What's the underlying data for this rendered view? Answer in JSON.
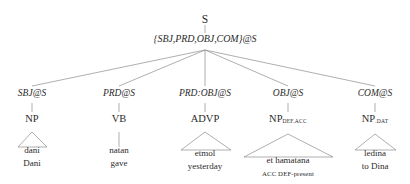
{
  "diagram": {
    "type": "syntax-tree",
    "root": {
      "label": "S"
    },
    "feature_set": {
      "label": "{SBJ,PRD,OBJ,COM}@S"
    },
    "branches": [
      {
        "function": "SBJ@S",
        "category": "NP",
        "subscript": "",
        "word": "dani",
        "gloss": "Dani",
        "gloss2": "",
        "leaf_connector": "triangle"
      },
      {
        "function": "PRD@S",
        "category": "VB",
        "subscript": "",
        "word": "natan",
        "gloss": "gave",
        "gloss2": "",
        "leaf_connector": "line"
      },
      {
        "function": "PRD:OBJ@S",
        "category": "ADVP",
        "subscript": "",
        "word": "etmol",
        "gloss": "yesterday",
        "gloss2": "",
        "leaf_connector": "triangle"
      },
      {
        "function": "OBJ@S",
        "category": "NP",
        "subscript": "DEF.ACC",
        "word": "et hamatana",
        "gloss": "ACC DEF-present",
        "gloss2": "",
        "leaf_connector": "triangle"
      },
      {
        "function": "COM@S",
        "category": "NP",
        "subscript": ".DAT",
        "word": "ledina",
        "gloss": "to Dina",
        "gloss2": "",
        "leaf_connector": "triangle"
      }
    ],
    "colors": {
      "ink": "#2b2b2b",
      "line": "#8c8c8c",
      "background": "#ffffff"
    }
  }
}
